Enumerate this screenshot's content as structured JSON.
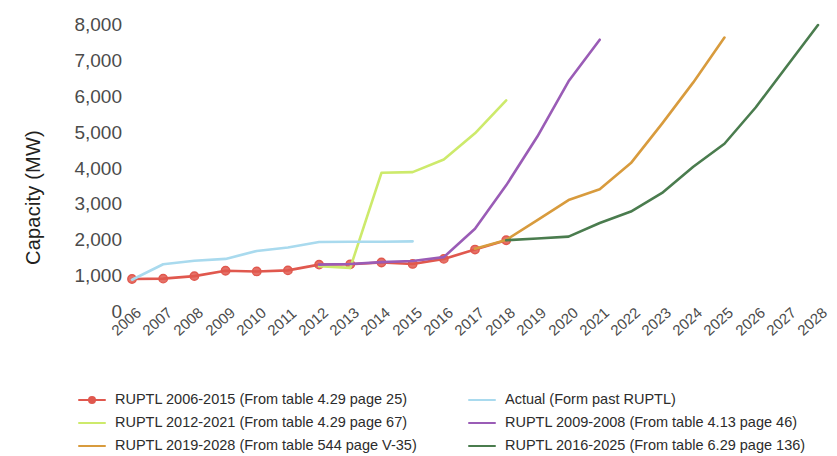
{
  "chart_data": {
    "type": "line",
    "title": "",
    "xlabel": "",
    "ylabel": "Capacity (MW)",
    "ylim": [
      0,
      8000
    ],
    "ytick_values": [
      0,
      1000,
      2000,
      3000,
      4000,
      5000,
      6000,
      7000,
      8000
    ],
    "ytick_labels": [
      "0",
      "1,000",
      "2,000",
      "3,000",
      "4,000",
      "5,000",
      "6,000",
      "7,000",
      "8,000"
    ],
    "grid": false,
    "legend_position": "bottom",
    "x": [
      2006,
      2007,
      2008,
      2009,
      2010,
      2011,
      2012,
      2013,
      2014,
      2015,
      2016,
      2017,
      2018,
      2019,
      2020,
      2021,
      2022,
      2023,
      2024,
      2025,
      2026,
      2027,
      2028
    ],
    "categories": [
      "2006",
      "2007",
      "2008",
      "2009",
      "2010",
      "2011",
      "2012",
      "2013",
      "2014",
      "2015",
      "2016",
      "2017",
      "2018",
      "2019",
      "2020",
      "2021",
      "2022",
      "2023",
      "2024",
      "2025",
      "2026",
      "2027",
      "2028"
    ],
    "series": [
      {
        "name": "RUPTL 2006-2015 (From table 4.29 page 25)",
        "color": "#e0584e",
        "markers": true,
        "x": [
          2006,
          2007,
          2008,
          2009,
          2010,
          2011,
          2012,
          2013,
          2014,
          2015,
          2016,
          2017,
          2018
        ],
        "values": [
          920,
          930,
          1000,
          1150,
          1130,
          1160,
          1320,
          1330,
          1380,
          1340,
          1480,
          1740,
          2000
        ]
      },
      {
        "name": "RUPTL 2012-2021 (From table 4.29 page 67)",
        "color": "#cdea6b",
        "markers": false,
        "x": [
          2012,
          2013,
          2014,
          2015,
          2016,
          2017,
          2018
        ],
        "values": [
          1280,
          1230,
          3880,
          3900,
          4250,
          4980,
          5900
        ]
      },
      {
        "name": "RUPTL 2019-2028 (From table 544 page V-35)",
        "color": "#d89b3d",
        "markers": false,
        "x": [
          2017,
          2018,
          2019,
          2020,
          2021,
          2022,
          2023,
          2024,
          2025
        ],
        "values": [
          1760,
          2010,
          2560,
          3120,
          3420,
          4150,
          5250,
          6400,
          7650
        ]
      },
      {
        "name": "Actual (Form past RUPTL)",
        "color": "#a9daee",
        "markers": false,
        "x": [
          2006,
          2007,
          2008,
          2009,
          2010,
          2011,
          2012,
          2013,
          2014,
          2015
        ],
        "values": [
          900,
          1330,
          1430,
          1480,
          1700,
          1800,
          1950,
          1960,
          1960,
          1970
        ]
      },
      {
        "name": "RUPTL 2009-2008 (From table 4.13 page 46)",
        "color": "#9a5cb6",
        "markers": false,
        "x": [
          2012,
          2013,
          2014,
          2015,
          2016,
          2017,
          2018,
          2019,
          2020,
          2021
        ],
        "values": [
          1320,
          1340,
          1390,
          1420,
          1530,
          2320,
          3530,
          4890,
          6430,
          7590
        ]
      },
      {
        "name": "RUPTL 2016-2025 (From table 6.29 page 136)",
        "color": "#4a7c4e",
        "markers": false,
        "x": [
          2018,
          2019,
          2020,
          2021,
          2022,
          2023,
          2024,
          2025,
          2026,
          2027,
          2028
        ],
        "values": [
          2000,
          2050,
          2100,
          2480,
          2800,
          3320,
          4050,
          4690,
          5700,
          6850,
          8000
        ]
      }
    ]
  },
  "legend": {
    "items": [
      {
        "label": "RUPTL 2006-2015 (From table 4.29 page 25)",
        "color": "#e0584e",
        "marker": "dot-line",
        "icon": "legend-line-marker-icon"
      },
      {
        "label": "Actual (Form past RUPTL)",
        "color": "#a9daee",
        "marker": "line",
        "icon": "legend-line-icon"
      },
      {
        "label": "RUPTL 2012-2021 (From table 4.29 page 67)",
        "color": "#cdea6b",
        "marker": "line",
        "icon": "legend-line-icon"
      },
      {
        "label": "RUPTL 2009-2008 (From table 4.13 page 46)",
        "color": "#9a5cb6",
        "marker": "line",
        "icon": "legend-line-icon"
      },
      {
        "label": "RUPTL 2019-2028 (From table 544 page V-35)",
        "color": "#d89b3d",
        "marker": "line",
        "icon": "legend-line-icon"
      },
      {
        "label": "RUPTL 2016-2025 (From table 6.29 page 136)",
        "color": "#4a7c4e",
        "marker": "line",
        "icon": "legend-line-icon"
      }
    ]
  }
}
